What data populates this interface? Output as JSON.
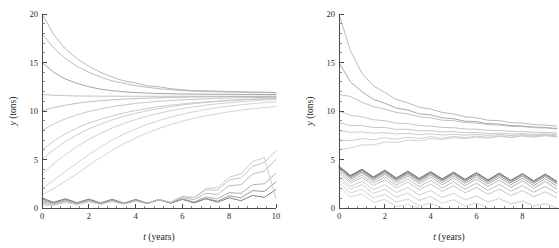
{
  "figure": {
    "title": "",
    "panels": [
      "left",
      "right"
    ]
  },
  "chart_data": [
    {
      "id": "left",
      "type": "line",
      "title": "",
      "subtitle": "",
      "xlabel": "t (years)",
      "xlabel_italic_part": "t",
      "xlabel_rest": " (years)",
      "ylabel": "y (tons)",
      "ylabel_italic_part": "y",
      "ylabel_rest": " (tons)",
      "xlim": [
        0,
        10
      ],
      "ylim": [
        0,
        20
      ],
      "xticks": [
        0,
        2,
        4,
        6,
        8,
        10
      ],
      "xticklabels": [
        "0",
        "2",
        "4",
        "6",
        "8",
        "10"
      ],
      "xminor_step": 0.4,
      "yticks": [
        0,
        5,
        10,
        15,
        20
      ],
      "yticklabels": [
        "0",
        "5",
        "10",
        "15",
        "20"
      ],
      "yminor_step": 1,
      "grid": false,
      "legend": null,
      "annotations": [],
      "description": "Sawtooth harvest trajectories converging to a stable cycle near y = 11.5 tons; low-start trajectories remain near zero then rise after year 7.",
      "series": [
        {
          "name": "y0=20.0",
          "color": "#a8a8a8",
          "width": 0.8,
          "values": [
            20.0,
            17.9,
            16.4,
            15.4,
            14.6,
            14.0,
            13.5,
            13.1,
            12.9,
            12.6,
            12.5,
            12.3,
            12.2,
            12.1,
            12.1,
            12.05,
            12.0,
            12.0,
            11.95,
            11.95,
            11.9
          ]
        },
        {
          "name": "y0=18.0",
          "color": "#aaaaaa",
          "width": 0.8,
          "values": [
            18.0,
            16.5,
            15.4,
            14.6,
            14.0,
            13.5,
            13.1,
            12.85,
            12.6,
            12.45,
            12.3,
            12.2,
            12.1,
            12.05,
            12.0,
            11.98,
            11.95,
            11.93,
            11.9,
            11.9,
            11.88
          ]
        },
        {
          "name": "y0=15.0",
          "color": "#9a9a9a",
          "width": 0.9,
          "values": [
            15.0,
            14.0,
            13.3,
            12.85,
            12.5,
            12.25,
            12.1,
            11.98,
            11.9,
            11.85,
            11.8,
            11.78,
            11.75,
            11.74,
            11.73,
            11.72,
            11.72,
            11.71,
            11.71,
            11.7,
            11.7
          ]
        },
        {
          "name": "y0=11.7",
          "color": "#b4b4b4",
          "width": 0.8,
          "values": [
            11.7,
            11.62,
            11.58,
            11.55,
            11.54,
            11.53,
            11.53,
            11.52,
            11.52,
            11.52,
            11.52,
            11.52,
            11.52,
            11.52,
            11.52,
            11.52,
            11.52,
            11.52,
            11.52,
            11.52,
            11.52
          ]
        },
        {
          "name": "y0=10.0",
          "color": "#b0b0b0",
          "width": 0.8,
          "values": [
            10.0,
            10.35,
            10.6,
            10.8,
            10.95,
            11.05,
            11.15,
            11.22,
            11.28,
            11.32,
            11.36,
            11.39,
            11.42,
            11.44,
            11.46,
            11.47,
            11.48,
            11.49,
            11.5,
            11.5,
            11.51
          ]
        },
        {
          "name": "y0=8.0",
          "color": "#b8b8b8",
          "width": 0.8,
          "values": [
            8.0,
            8.65,
            9.2,
            9.6,
            9.95,
            10.2,
            10.45,
            10.62,
            10.78,
            10.9,
            11.0,
            11.08,
            11.15,
            11.2,
            11.26,
            11.3,
            11.33,
            11.36,
            11.38,
            11.4,
            11.42
          ]
        },
        {
          "name": "y0=6.0",
          "color": "#bcbcbc",
          "width": 0.8,
          "values": [
            6.0,
            6.9,
            7.65,
            8.25,
            8.75,
            9.15,
            9.5,
            9.8,
            10.05,
            10.25,
            10.45,
            10.6,
            10.73,
            10.84,
            10.94,
            11.02,
            11.09,
            11.15,
            11.2,
            11.25,
            11.29
          ]
        },
        {
          "name": "y0=5.0",
          "color": "#c0c0c0",
          "width": 0.8,
          "values": [
            5.0,
            6.0,
            6.85,
            7.55,
            8.15,
            8.65,
            9.08,
            9.45,
            9.76,
            10.02,
            10.25,
            10.45,
            10.62,
            10.76,
            10.88,
            10.99,
            11.08,
            11.16,
            11.22,
            11.28,
            11.33
          ]
        },
        {
          "name": "y0=3.5",
          "color": "#c4c4c4",
          "width": 0.8,
          "values": [
            3.5,
            4.55,
            5.5,
            6.35,
            7.08,
            7.7,
            8.25,
            8.72,
            9.12,
            9.47,
            9.77,
            10.03,
            10.25,
            10.44,
            10.6,
            10.74,
            10.86,
            10.96,
            11.05,
            11.13,
            11.19
          ]
        },
        {
          "name": "y0=2.0",
          "color": "#c8c8c8",
          "width": 0.8,
          "values": [
            2.0,
            2.85,
            3.75,
            4.65,
            5.5,
            6.3,
            7.0,
            7.62,
            8.15,
            8.62,
            9.02,
            9.37,
            9.67,
            9.93,
            10.15,
            10.34,
            10.5,
            10.64,
            10.76,
            10.87,
            10.96
          ]
        },
        {
          "name": "y0=1.4",
          "color": "#cacaca",
          "width": 0.8,
          "values": [
            1.4,
            2.0,
            2.75,
            3.55,
            4.4,
            5.2,
            5.95,
            6.62,
            7.22,
            7.75,
            8.2,
            8.6,
            8.95,
            9.25,
            9.5,
            9.72,
            9.92,
            10.08,
            10.23,
            10.35,
            10.46
          ]
        },
        {
          "name": "y0=1.0a",
          "color": "#808080",
          "width": 1.0,
          "values": [
            1.0,
            0.6,
            0.95,
            0.55,
            0.92,
            0.52,
            0.9,
            0.5,
            0.88,
            0.5,
            0.88,
            0.5,
            0.9,
            0.52,
            0.95,
            0.6,
            1.05,
            0.75,
            1.3,
            1.1,
            1.9
          ]
        },
        {
          "name": "y0=0.9",
          "color": "#8c8c8c",
          "width": 0.9,
          "values": [
            0.9,
            0.55,
            0.9,
            0.52,
            0.88,
            0.5,
            0.86,
            0.48,
            0.85,
            0.48,
            0.85,
            0.5,
            0.9,
            0.55,
            1.0,
            0.7,
            1.25,
            1.05,
            1.8,
            1.7,
            2.7
          ]
        },
        {
          "name": "y0=0.75",
          "color": "#9c9c9c",
          "width": 0.8,
          "values": [
            0.75,
            0.48,
            0.82,
            0.48,
            0.82,
            0.46,
            0.8,
            0.45,
            0.8,
            0.46,
            0.82,
            0.5,
            0.92,
            0.62,
            1.15,
            0.95,
            1.6,
            1.5,
            2.4,
            2.5,
            3.6
          ]
        },
        {
          "name": "y0=0.6",
          "color": "#aaaaaa",
          "width": 0.8,
          "values": [
            0.6,
            0.42,
            0.75,
            0.44,
            0.78,
            0.44,
            0.77,
            0.44,
            0.78,
            0.46,
            0.85,
            0.55,
            1.05,
            0.85,
            1.5,
            1.4,
            2.3,
            2.4,
            3.5,
            3.8,
            5.0
          ]
        },
        {
          "name": "y0=0.45",
          "color": "#b6b6b6",
          "width": 0.8,
          "values": [
            0.45,
            0.36,
            0.68,
            0.4,
            0.72,
            0.42,
            0.73,
            0.42,
            0.76,
            0.46,
            0.88,
            0.6,
            1.2,
            1.05,
            1.85,
            1.85,
            2.9,
            3.1,
            4.3,
            4.7,
            5.9
          ]
        },
        {
          "name": "y0=0.3",
          "color": "#c2c2c2",
          "width": 0.8,
          "values": [
            0.3,
            0.28,
            0.55,
            0.34,
            0.62,
            0.38,
            0.66,
            0.4,
            0.7,
            0.44,
            0.85,
            0.6,
            1.2,
            1.1,
            2.0,
            2.1,
            3.2,
            3.5,
            4.8,
            5.2,
            1.0
          ]
        }
      ]
    },
    {
      "id": "right",
      "type": "line",
      "title": "",
      "subtitle": "",
      "xlabel": "t (years)",
      "xlabel_italic_part": "t",
      "xlabel_rest": " (years)",
      "ylabel": "y (tons)",
      "ylabel_italic_part": "y",
      "ylabel_rest": " (tons)",
      "xlim": [
        0,
        9.6
      ],
      "ylim": [
        0,
        20
      ],
      "xticks": [
        0,
        2,
        4,
        6,
        8
      ],
      "xticklabels": [
        "0",
        "2",
        "4",
        "6",
        "8"
      ],
      "xminor_step": 0.4,
      "yticks": [
        0,
        5,
        10,
        15,
        20
      ],
      "yticklabels": [
        "0",
        "5",
        "10",
        "15",
        "20"
      ],
      "yminor_step": 1,
      "grid": false,
      "legend": null,
      "annotations": [],
      "description": "Over-harvested trajectories: all curves decline with sawtooth oscillation toward an upper band near 8 tons and a lower band near 3 tons; the lowest trajectories reach zero (extinction) between years 4 and 9.",
      "series": [
        {
          "name": "y0=20.0",
          "color": "#a8a8a8",
          "width": 0.8,
          "values": [
            20.0,
            16.2,
            13.9,
            12.6,
            11.9,
            11.2,
            10.85,
            10.4,
            10.2,
            9.85,
            9.7,
            9.4,
            9.3,
            9.05,
            9.0,
            8.8,
            8.75,
            8.6,
            8.55,
            8.45
          ]
        },
        {
          "name": "y0=15.0",
          "color": "#9e9e9e",
          "width": 0.9,
          "values": [
            15.0,
            13.0,
            12.0,
            11.2,
            10.8,
            10.3,
            10.1,
            9.7,
            9.6,
            9.3,
            9.2,
            8.95,
            8.9,
            8.7,
            8.65,
            8.5,
            8.45,
            8.35,
            8.3,
            8.2
          ]
        },
        {
          "name": "y0=11.7",
          "color": "#b2b2b2",
          "width": 0.8,
          "values": [
            11.7,
            11.5,
            10.9,
            10.45,
            10.2,
            9.85,
            9.7,
            9.4,
            9.3,
            9.05,
            9.0,
            8.8,
            8.75,
            8.6,
            8.55,
            8.4,
            8.4,
            8.28,
            8.25,
            8.15
          ]
        },
        {
          "name": "y0=10.0",
          "color": "#b6b6b6",
          "width": 0.8,
          "values": [
            10.0,
            9.55,
            9.4,
            9.1,
            9.0,
            8.75,
            8.7,
            8.5,
            8.45,
            8.3,
            8.28,
            8.15,
            8.12,
            8.0,
            8.0,
            7.9,
            7.9,
            7.8,
            7.8,
            7.72
          ]
        },
        {
          "name": "y0=8.8",
          "color": "#bababa",
          "width": 0.8,
          "values": [
            8.8,
            8.5,
            8.5,
            8.3,
            8.3,
            8.1,
            8.12,
            7.95,
            7.98,
            7.85,
            7.88,
            7.75,
            7.8,
            7.68,
            7.72,
            7.62,
            7.68,
            7.58,
            7.64,
            7.55
          ]
        },
        {
          "name": "y0=8.0",
          "color": "#bebebe",
          "width": 0.8,
          "values": [
            8.0,
            7.8,
            7.85,
            7.7,
            7.78,
            7.62,
            7.7,
            7.56,
            7.65,
            7.52,
            7.62,
            7.5,
            7.6,
            7.48,
            7.58,
            7.46,
            7.56,
            7.44,
            7.55,
            7.43
          ]
        },
        {
          "name": "y0=7.0",
          "color": "#c2c2c2",
          "width": 0.8,
          "values": [
            7.0,
            6.95,
            7.15,
            7.05,
            7.25,
            7.1,
            7.3,
            7.15,
            7.35,
            7.2,
            7.4,
            7.25,
            7.42,
            7.28,
            7.45,
            7.3,
            7.48,
            7.32,
            7.5,
            7.35
          ]
        },
        {
          "name": "y0=6.0",
          "color": "#c6c6c6",
          "width": 0.8,
          "values": [
            6.0,
            6.2,
            6.5,
            6.5,
            6.8,
            6.75,
            7.0,
            6.92,
            7.15,
            7.05,
            7.25,
            7.15,
            7.3,
            7.2,
            7.38,
            7.25,
            7.42,
            7.3,
            7.45,
            7.32
          ]
        },
        {
          "name": "y0=4.3a",
          "color": "#6e6e6e",
          "width": 1.0,
          "values": [
            4.3,
            3.35,
            4.0,
            3.2,
            3.9,
            3.1,
            3.8,
            3.05,
            3.75,
            3.0,
            3.7,
            2.95,
            3.65,
            2.9,
            3.6,
            2.85,
            3.55,
            2.8,
            3.5,
            2.75
          ]
        },
        {
          "name": "y0=4.25",
          "color": "#787878",
          "width": 0.9,
          "values": [
            4.25,
            3.28,
            3.92,
            3.12,
            3.82,
            3.02,
            3.72,
            2.95,
            3.65,
            2.9,
            3.6,
            2.85,
            3.55,
            2.8,
            3.5,
            2.75,
            3.45,
            2.7,
            3.4,
            2.65
          ]
        },
        {
          "name": "y0=4.2",
          "color": "#868686",
          "width": 0.9,
          "values": [
            4.2,
            3.2,
            3.85,
            3.05,
            3.72,
            2.92,
            3.6,
            2.85,
            3.55,
            2.8,
            3.5,
            2.72,
            3.42,
            2.65,
            3.35,
            2.6,
            3.3,
            2.55,
            3.25,
            2.5
          ]
        },
        {
          "name": "y0=4.1",
          "color": "#969696",
          "width": 0.8,
          "values": [
            4.1,
            3.1,
            3.72,
            2.92,
            3.6,
            2.8,
            3.48,
            2.7,
            3.4,
            2.62,
            3.3,
            2.55,
            3.22,
            2.46,
            3.14,
            2.4,
            3.06,
            2.32,
            3.0,
            2.26
          ]
        },
        {
          "name": "y0=4.0",
          "color": "#a2a2a2",
          "width": 0.8,
          "values": [
            4.0,
            2.98,
            3.6,
            2.78,
            3.44,
            2.62,
            3.3,
            2.5,
            3.18,
            2.4,
            3.08,
            2.3,
            2.98,
            2.2,
            2.88,
            2.12,
            2.8,
            2.04,
            2.72,
            1.96
          ]
        },
        {
          "name": "y0=3.8",
          "color": "#aeaeae",
          "width": 0.8,
          "values": [
            3.8,
            2.78,
            3.38,
            2.55,
            3.18,
            2.36,
            3.0,
            2.2,
            2.84,
            2.06,
            2.7,
            1.94,
            2.56,
            1.82,
            2.44,
            1.72,
            2.32,
            1.62,
            2.22,
            1.54
          ]
        },
        {
          "name": "y0=3.6",
          "color": "#b8b8b8",
          "width": 0.8,
          "values": [
            3.6,
            2.58,
            3.14,
            2.3,
            2.9,
            2.08,
            2.68,
            1.88,
            2.48,
            1.72,
            2.3,
            1.56,
            2.12,
            1.42,
            1.96,
            1.28,
            1.8,
            1.16,
            1.66,
            1.04
          ]
        },
        {
          "name": "y0=3.3",
          "color": "#c0c0c0",
          "width": 0.8,
          "values": [
            3.3,
            2.25,
            2.75,
            1.9,
            2.4,
            1.6,
            2.1,
            1.32,
            1.8,
            1.08,
            1.52,
            0.84,
            1.24,
            0.62,
            0.98,
            0.42,
            0.72,
            0.22,
            0.46,
            0.0
          ]
        },
        {
          "name": "y0=3.0",
          "color": "#c4c4c4",
          "width": 0.8,
          "values": [
            3.0,
            1.95,
            2.4,
            1.5,
            1.95,
            1.12,
            1.55,
            0.78,
            1.18,
            0.48,
            0.85,
            0.2,
            0.52,
            0.0
          ]
        },
        {
          "name": "y0=2.6",
          "color": "#c8c8c8",
          "width": 0.8,
          "values": [
            2.6,
            1.55,
            1.92,
            1.05,
            1.4,
            0.6,
            0.92,
            0.22,
            0.5,
            0.0
          ]
        },
        {
          "name": "y0=2.2",
          "color": "#cccccc",
          "width": 0.8,
          "values": [
            2.2,
            1.15,
            1.45,
            0.6,
            0.88,
            0.15,
            0.35,
            0.0
          ]
        }
      ]
    }
  ]
}
